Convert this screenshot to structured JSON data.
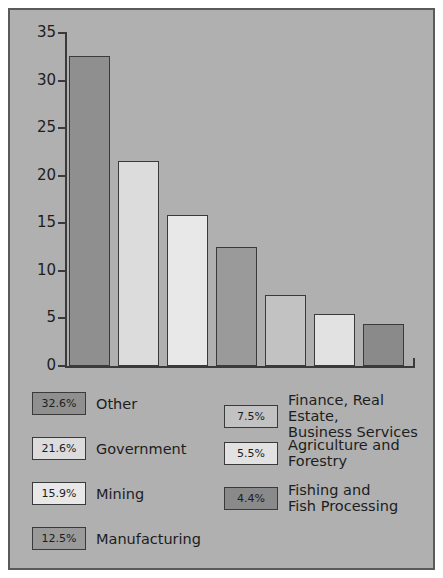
{
  "chart_data": {
    "type": "bar",
    "title": "",
    "xlabel": "",
    "ylabel": "",
    "ylim": [
      0,
      35
    ],
    "yticks": [
      0,
      5,
      10,
      15,
      20,
      25,
      30,
      35
    ],
    "grid": false,
    "legend_position": "below-plot-two-columns",
    "categories": [
      "Other",
      "Government",
      "Mining",
      "Manufacturing",
      "Finance, Real Estate,\nBusiness Services",
      "Agriculture and\nForestry",
      "Fishing and\nFish Processing"
    ],
    "values": [
      32.6,
      21.6,
      15.9,
      12.5,
      7.5,
      5.5,
      4.4
    ],
    "value_labels": [
      "32.6%",
      "21.6%",
      "15.9%",
      "12.5%",
      "7.5%",
      "5.5%",
      "4.4%"
    ],
    "colors": [
      "#8f8f8f",
      "#dcdcdc",
      "#e8e8e8",
      "#9a9a9a",
      "#c2c2c2",
      "#e2e2e2",
      "#8a8a8a"
    ]
  },
  "axis": {
    "tick_labels": [
      "35",
      "30",
      "25",
      "20",
      "15",
      "10",
      "5",
      "0"
    ]
  },
  "legend": {
    "left_column": [
      {
        "value": "32.6%",
        "label": "Other",
        "color": "#8f8f8f"
      },
      {
        "value": "21.6%",
        "label": "Government",
        "color": "#dcdcdc"
      },
      {
        "value": "15.9%",
        "label": "Mining",
        "color": "#e8e8e8"
      },
      {
        "value": "12.5%",
        "label": "Manufacturing",
        "color": "#9a9a9a"
      }
    ],
    "right_column": [
      {
        "value": "7.5%",
        "label": "Finance, Real Estate,\nBusiness Services",
        "color": "#c2c2c2"
      },
      {
        "value": "5.5%",
        "label": "Agriculture and\nForestry",
        "color": "#e2e2e2"
      },
      {
        "value": "4.4%",
        "label": "Fishing and\nFish Processing",
        "color": "#8a8a8a"
      }
    ]
  },
  "style": {
    "page_background": "#ffffff",
    "panel_background": "#b0b0b0",
    "border_color": "#5a5a5a",
    "ink_color": "#1d1d1d",
    "axis_color": "#3a3a3a"
  }
}
